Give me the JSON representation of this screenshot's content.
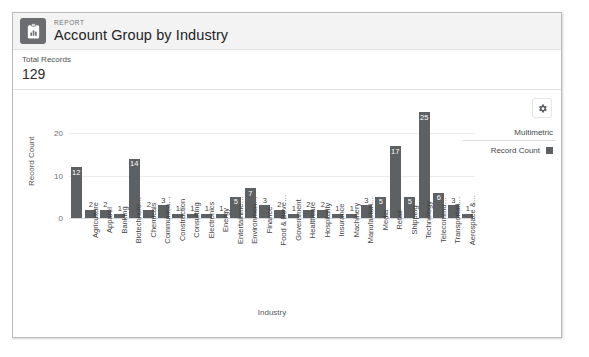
{
  "header": {
    "eyebrow": "REPORT",
    "title": "Account Group by Industry",
    "icon": "report-clipboard-chart-icon"
  },
  "totals": {
    "label": "Total Records",
    "value": "129"
  },
  "toolbar": {
    "settings_icon": "gear-icon"
  },
  "legend": {
    "title": "Multimetric",
    "entries": [
      {
        "label": "Record Count",
        "color": "#5e6163"
      }
    ]
  },
  "colors": {
    "bar": "#5e6163",
    "header_bg": "#f3f3f3",
    "card_border": "#b9bcbe",
    "gridline": "#ececec",
    "axis": "#d8d8d8"
  },
  "chart_data": {
    "type": "bar",
    "title": "Account Group by Industry",
    "xlabel": "Industry",
    "ylabel": "Record Count",
    "ylim": [
      0,
      26
    ],
    "yticks": [
      0,
      10,
      20
    ],
    "grid": true,
    "legend_position": "right",
    "categories": [
      "",
      "Agriculture",
      "Apparel",
      "Banking",
      "Biotechnolo…",
      "Chemicals",
      "Communica…",
      "Construction",
      "Consulting",
      "Electronics",
      "Energy",
      "Entertainme…",
      "Environmen…",
      "Finance",
      "Food & Beve…",
      "Government",
      "Healthcare",
      "Hospitality",
      "Insurance",
      "Machinery",
      "Manufacturi…",
      "Media",
      "Retail",
      "Shipping",
      "Technology",
      "Telecommu…",
      "Transportati…",
      "Aerospace &…"
    ],
    "values": [
      12,
      2,
      2,
      1,
      14,
      2,
      3,
      1,
      1,
      1,
      1,
      5,
      7,
      3,
      2,
      1,
      2,
      2,
      1,
      1,
      3,
      5,
      17,
      5,
      25,
      6,
      3,
      1
    ],
    "series": [
      {
        "name": "Record Count",
        "values": [
          12,
          2,
          2,
          1,
          14,
          2,
          3,
          1,
          1,
          1,
          1,
          5,
          7,
          3,
          2,
          1,
          2,
          2,
          1,
          1,
          3,
          5,
          17,
          5,
          25,
          6,
          3,
          1
        ]
      }
    ],
    "total": 129
  }
}
